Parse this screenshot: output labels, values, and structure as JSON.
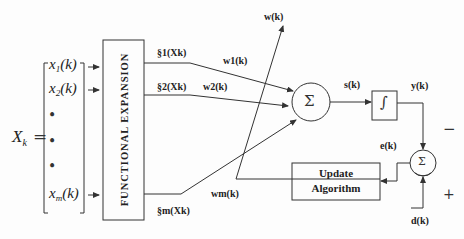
{
  "diagram": {
    "input_vector": {
      "label": "X",
      "label_subscript": "k",
      "equals": "=",
      "elements": [
        "x1(k)",
        "x2(k)",
        "•",
        "•",
        "•",
        "xm(k)"
      ],
      "element_display": [
        {
          "base": "x",
          "sub": "1",
          "arg": "(k)"
        },
        {
          "base": "x",
          "sub": "2",
          "arg": "(k)"
        },
        {
          "base": "x",
          "sub": "m",
          "arg": "(k)"
        }
      ]
    },
    "functional_expansion": {
      "label": "FUNCTIONAL   EXPANSION"
    },
    "expansion_outputs": [
      "§1(Xk)",
      "§2(Xk)",
      "§m(Xk)"
    ],
    "weights": [
      "w1(k)",
      "w2(k)",
      "wm(k)"
    ],
    "weight_vector_label": "w(k)",
    "summer_symbol": "Σ",
    "sum_output_label": "s(k)",
    "activation_symbol": "∫",
    "output_label": "y(k)",
    "error_label": "e(k)",
    "desired_label": "d(k)",
    "minus_sign": "−",
    "plus_sign": "+",
    "update_block": {
      "line1": "Update",
      "line2": "Algorithm"
    }
  }
}
